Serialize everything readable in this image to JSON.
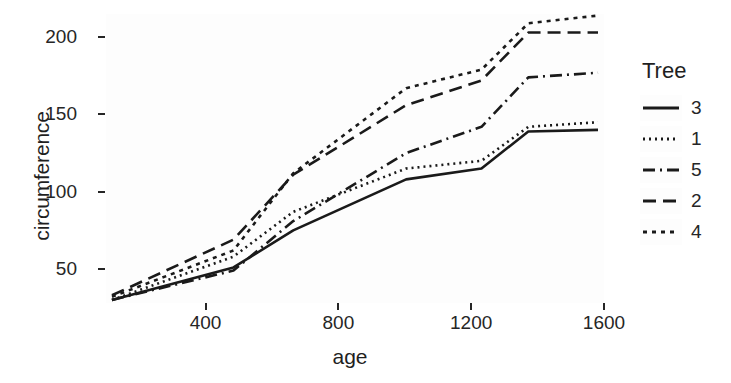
{
  "chart_data": {
    "type": "line",
    "title": "",
    "subtitle": "",
    "xlabel": "age",
    "ylabel": "circumference",
    "xlim": [
      100,
      1600
    ],
    "ylim": [
      28,
      215
    ],
    "xticks": [
      400,
      800,
      1200,
      1600
    ],
    "yticks": [
      50,
      100,
      150,
      200
    ],
    "grid": false,
    "legend_position": "right",
    "legend_title": "Tree",
    "x": [
      118,
      484,
      664,
      1004,
      1231,
      1372,
      1582
    ],
    "series": [
      {
        "name": "3",
        "label": "3",
        "linetype": "solid",
        "dasharray": "",
        "values": [
          30,
          51,
          75,
          108,
          115,
          139,
          140
        ]
      },
      {
        "name": "1",
        "label": "1",
        "linetype": "dotted",
        "dasharray": "2,4",
        "values": [
          30,
          58,
          87,
          115,
          120,
          142,
          145
        ]
      },
      {
        "name": "5",
        "label": "5",
        "linetype": "dotdash",
        "dasharray": "12,5,2,5",
        "values": [
          30,
          49,
          81,
          125,
          142,
          174,
          177
        ]
      },
      {
        "name": "2",
        "label": "2",
        "linetype": "dashed",
        "dasharray": "13,7",
        "values": [
          33,
          69,
          111,
          156,
          172,
          203,
          203
        ]
      },
      {
        "name": "4",
        "label": "4",
        "linetype": "longdash",
        "dasharray": "4,5",
        "values": [
          32,
          62,
          112,
          167,
          179,
          209,
          214
        ]
      }
    ],
    "colors": {
      "line": "#1a1a1a",
      "panel_background": "#fdfdfd",
      "plot_background": "#ffffff",
      "axis_text": "#262626"
    }
  },
  "axes": {
    "y": {
      "title": "circumference",
      "ticks": [
        {
          "label": "200",
          "value": 200
        },
        {
          "label": "150",
          "value": 150
        },
        {
          "label": "100",
          "value": 100
        },
        {
          "label": "50",
          "value": 50
        }
      ]
    },
    "x": {
      "title": "age",
      "ticks": [
        {
          "label": "400",
          "value": 400
        },
        {
          "label": "800",
          "value": 800
        },
        {
          "label": "1200",
          "value": 1200
        },
        {
          "label": "1600",
          "value": 1600
        }
      ]
    }
  },
  "legend": {
    "title": "Tree",
    "items": [
      {
        "label": "3",
        "linetype": "solid"
      },
      {
        "label": "1",
        "linetype": "dotted"
      },
      {
        "label": "5",
        "linetype": "dotdash"
      },
      {
        "label": "2",
        "linetype": "dashed"
      },
      {
        "label": "4",
        "linetype": "longdash"
      }
    ]
  }
}
